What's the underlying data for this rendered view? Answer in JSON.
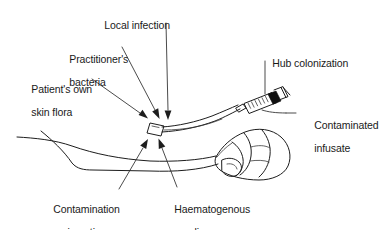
{
  "diagram": {
    "background_color": "#ffffff",
    "line_color": "#1d1d1d",
    "text_color": "#1a1a1a",
    "width": 385,
    "height": 230,
    "labels": [
      {
        "id": "local-infection",
        "text": "Local infection",
        "line1": "Local infection",
        "line2": "",
        "x": 93,
        "y": 8,
        "leader_from": [
          165,
          22
        ],
        "leader_to": [
          168,
          112
        ],
        "has_arrow": true
      },
      {
        "id": "practitioners-bacteria",
        "text": "Practitioner's bacteria",
        "line1": "Practitioner's",
        "line2": "bacteria",
        "x": 58,
        "y": 42,
        "leader_from": [
          121,
          47
        ],
        "leader_to": [
          157,
          112
        ],
        "has_arrow": true
      },
      {
        "id": "patients-own-skin-flora",
        "text": "Patient's own skin flora",
        "line1": "Patient's own",
        "line2": "skin flora",
        "x": 20,
        "y": 72,
        "leader_from": [
          90,
          78
        ],
        "leader_to": [
          147,
          115
        ],
        "has_arrow": true
      },
      {
        "id": "hub-colonization",
        "text": "Hub colonization",
        "line1": "Hub colonization",
        "line2": "",
        "x": 261,
        "y": 46,
        "leader_from": [
          265,
          60
        ],
        "leader_to": [
          265,
          95
        ],
        "has_arrow": false
      },
      {
        "id": "contaminated-infusate",
        "text": "Contaminated infusate",
        "line1": "Contaminated",
        "line2": "infusate",
        "x": 299,
        "y": 108,
        "leader_from": [
          288,
          114
        ],
        "leader_to": [
          263,
          114
        ],
        "has_arrow": false
      },
      {
        "id": "contamination-on-insertion",
        "text": "Contamination on insertion",
        "line1": "Contamination",
        "line2": "on insertion",
        "x": 42,
        "y": 192,
        "leader_from": [
          118,
          190
        ],
        "leader_to": [
          151,
          141
        ],
        "has_arrow": true
      },
      {
        "id": "haematogenous-seeding",
        "text": "Haematogenous seeding",
        "line1": "Haematogenous",
        "line2": "seeding",
        "x": 163,
        "y": 192,
        "leader_from": [
          176,
          188
        ],
        "leader_to": [
          163,
          141
        ],
        "has_arrow": true
      }
    ],
    "anatomy": {
      "forearm": "left forearm in side profile",
      "hand": "closed fist at right",
      "insertion_site": "cannula entry patch on forearm",
      "insertion_site_position": [
        155,
        128
      ]
    },
    "device": {
      "syringe": "graduated syringe barrel with plunger",
      "hub": "dark catheter hub",
      "tubing": "extension tubing from insertion site to syringe",
      "graduation_count": 9
    }
  }
}
